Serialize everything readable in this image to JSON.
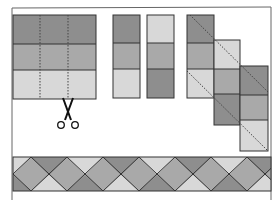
{
  "diagram": {
    "colors": {
      "dark": "#8e8e8e",
      "medium": "#a9a9a9",
      "light": "#d8d8d8",
      "outline": "#333333",
      "frame": "#555555",
      "background": "#ffffff"
    },
    "steps": [
      {
        "id": "strip-set",
        "label": "Sewn strip set (dark, medium, light) with dotted cutting lines"
      },
      {
        "id": "cut-segments",
        "label": "Cut segments, one flipped"
      },
      {
        "id": "offset-segments",
        "label": "Segments sewn offset with diagonal trim lines"
      },
      {
        "id": "finished-border",
        "label": "Finished diagonal set border"
      }
    ],
    "icons": {
      "scissors": "scissors-icon"
    }
  }
}
